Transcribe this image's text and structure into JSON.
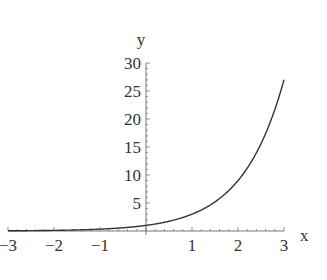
{
  "chart_data": {
    "type": "line",
    "title": "",
    "function": "y = 3^x",
    "xlabel": "x",
    "ylabel": "y",
    "xlim": [
      -3,
      3
    ],
    "ylim": [
      0,
      30
    ],
    "grid": false,
    "legend": null,
    "x_ticks": [
      -3,
      -2,
      -1,
      1,
      2,
      3
    ],
    "x_tick_labels": [
      "−3",
      "−2",
      "−1",
      "1",
      "2",
      "3"
    ],
    "y_ticks": [
      5,
      10,
      15,
      20,
      25,
      30
    ],
    "y_tick_labels": [
      "5",
      "10",
      "15",
      "20",
      "25",
      "30"
    ],
    "series": [
      {
        "name": "3^x",
        "x": [
          -3,
          -2.5,
          -2,
          -1.5,
          -1,
          -0.5,
          0,
          0.5,
          1,
          1.5,
          2,
          2.5,
          3
        ],
        "values": [
          0.037,
          0.064,
          0.111,
          0.192,
          0.333,
          0.577,
          1,
          1.732,
          3,
          5.196,
          9,
          15.59,
          27
        ],
        "color": "#333333"
      }
    ]
  }
}
